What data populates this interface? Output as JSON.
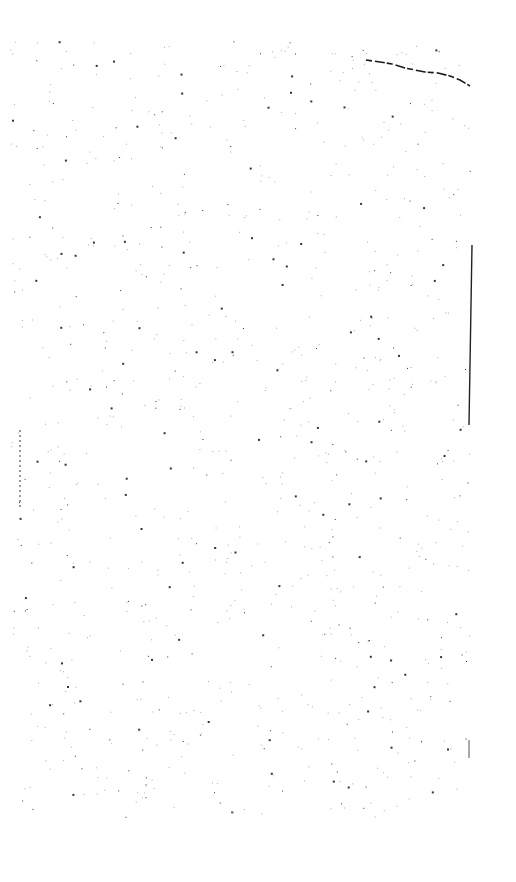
{
  "page": {
    "type": "blank scanned page",
    "background": "#ffffff",
    "ink_color": "#1a1a1a",
    "text": ""
  },
  "marks": {
    "top_right_curve": [
      [
        366,
        60
      ],
      [
        380,
        62
      ],
      [
        392,
        64
      ],
      [
        405,
        68
      ],
      [
        415,
        70
      ],
      [
        425,
        72
      ],
      [
        438,
        73
      ],
      [
        450,
        76
      ],
      [
        460,
        80
      ],
      [
        470,
        86
      ]
    ],
    "right_edge_line": {
      "x1": 472,
      "y1": 245,
      "x2": 469,
      "y2": 425
    },
    "right_edge_short": {
      "x1": 469,
      "y1": 740,
      "x2": 469,
      "y2": 758
    },
    "left_edge_marks": {
      "x": 20,
      "y1": 430,
      "y2": 510
    }
  }
}
